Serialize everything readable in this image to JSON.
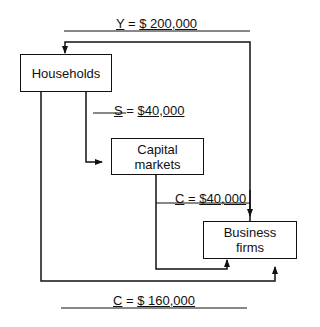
{
  "diagram": {
    "nodes": {
      "households": "Households",
      "capital_markets_line1": "Capital",
      "capital_markets_line2": "markets",
      "business_firms_line1": "Business",
      "business_firms_line2": "firms"
    },
    "flows": {
      "income": {
        "var": "Y",
        "eq": " = ",
        "value": "$ 200,000",
        "from": "Business firms",
        "to": "Households"
      },
      "saving": {
        "var": "S",
        "eq": " = ",
        "value": "$40,000",
        "from": "Households",
        "to": "Capital markets"
      },
      "investment_consumption": {
        "var": "C",
        "eq": " = ",
        "value": "$40,000",
        "from": "Capital markets",
        "to": "Business firms"
      },
      "consumption": {
        "var": "C",
        "eq": " = ",
        "value": "$ 160,000",
        "from": "Households",
        "to": "Business firms"
      }
    }
  }
}
